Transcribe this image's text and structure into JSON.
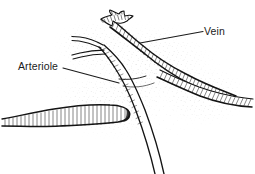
{
  "figure": {
    "style": "pen-and-ink hatched line drawing with stipple shading",
    "background_color": "#ffffff",
    "ink_color": "#141414",
    "width_px": 255,
    "height_px": 174
  },
  "labels": [
    {
      "id": "vein",
      "text": "Vein",
      "x": 204,
      "y": 26,
      "leader_from_x": 203,
      "leader_from_y": 32,
      "leader_to_x": 140,
      "leader_to_y": 43
    },
    {
      "id": "arteriole",
      "text": "Arteriole",
      "x": 18,
      "y": 61,
      "leader_from_x": 63,
      "leader_from_y": 68,
      "leader_to_x": 119,
      "leader_to_y": 83
    }
  ],
  "structures": [
    {
      "id": "vein-main",
      "name": "Vein",
      "description": "Large hatched vessel running from frayed upper-left end diagonally down to the right margin"
    },
    {
      "id": "vein-torn-end",
      "name": "Torn vessel end",
      "description": "Frayed ragged cut end of the vein at the top of the figure"
    },
    {
      "id": "vein-branch-right",
      "name": "Vein branch",
      "description": "Branch of the vein curving toward the lower right edge"
    },
    {
      "id": "arteriole-main",
      "name": "Arteriole",
      "description": "Slender vessel crossing under the vein and descending to the bottom margin"
    },
    {
      "id": "arteriole-branch-upper",
      "name": "Arteriole branch",
      "description": "Thin upper branch of the arteriole extending to the left"
    },
    {
      "id": "arteriole-branch-lower",
      "name": "Arteriole branch",
      "description": "Thin lower branch of the arteriole extending to the left"
    },
    {
      "id": "vessel-stub-left",
      "name": "Vessel stub",
      "description": "Blunt-ended hatched vessel segment entering from the left margin"
    }
  ]
}
